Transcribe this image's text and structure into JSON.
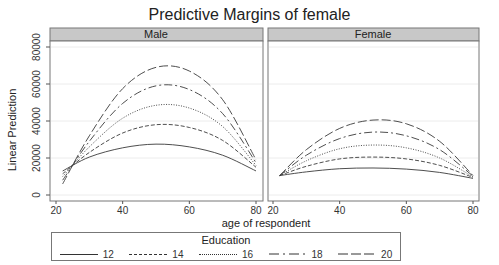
{
  "chart_data": {
    "type": "line",
    "title": "Predictive Margins of female",
    "xlabel": "age of respondent",
    "ylabel": "Linear Prediction",
    "xlim": [
      20,
      80
    ],
    "ylim": [
      0,
      80000
    ],
    "xticks": [
      20,
      40,
      60,
      80
    ],
    "yticks": [
      0,
      20000,
      40000,
      60000,
      80000
    ],
    "grid": true,
    "legend_title": "Education",
    "legend_position": "bottom",
    "panels": [
      {
        "name": "Male",
        "x": [
          22,
          30,
          40,
          50,
          60,
          70,
          80
        ],
        "series": [
          {
            "name": "12",
            "style": "solid",
            "values": [
              13000,
              20500,
              25500,
              27500,
              26000,
              21500,
              13000
            ]
          },
          {
            "name": "14",
            "style": "dash",
            "values": [
              11500,
              23000,
              33500,
              38000,
              36500,
              29500,
              15000
            ]
          },
          {
            "name": "16",
            "style": "dot",
            "values": [
              10000,
              26000,
              41500,
              48500,
              47000,
              37000,
              16000
            ]
          },
          {
            "name": "18",
            "style": "longdash-dot",
            "values": [
              8000,
              29000,
              49500,
              59000,
              57000,
              44000,
              17500
            ]
          },
          {
            "name": "20",
            "style": "longdash",
            "values": [
              6000,
              32000,
              57500,
              69000,
              67000,
              51500,
              19000
            ]
          }
        ]
      },
      {
        "name": "Female",
        "x": [
          22,
          30,
          40,
          50,
          60,
          70,
          80
        ],
        "series": [
          {
            "name": "12",
            "style": "solid",
            "values": [
              10500,
              12500,
              14200,
              14600,
              14000,
              12200,
              9000
            ]
          },
          {
            "name": "14",
            "style": "dash",
            "values": [
              10500,
              15500,
              19500,
              20500,
              19500,
              16000,
              9500
            ]
          },
          {
            "name": "16",
            "style": "dot",
            "values": [
              10500,
              18500,
              25000,
              27000,
              25500,
              20000,
              9800
            ]
          },
          {
            "name": "18",
            "style": "longdash-dot",
            "values": [
              10500,
              21500,
              30500,
              34000,
              32000,
              24500,
              10200
            ]
          },
          {
            "name": "20",
            "style": "longdash",
            "values": [
              10500,
              24500,
              36000,
              40500,
              38500,
              29000,
              10500
            ]
          }
        ]
      }
    ]
  },
  "labels": {
    "title": "Predictive Margins of female",
    "xlabel": "age of respondent",
    "ylabel": "Linear Prediction",
    "panel_left": "Male",
    "panel_right": "Female",
    "legend_title": "Education",
    "legend_items": [
      "12",
      "14",
      "16",
      "18",
      "20"
    ]
  },
  "colors": {
    "strip_bg": "#c8c8c8",
    "line": "#3a3a3a",
    "grid": "#ececec",
    "frame": "#777777"
  }
}
